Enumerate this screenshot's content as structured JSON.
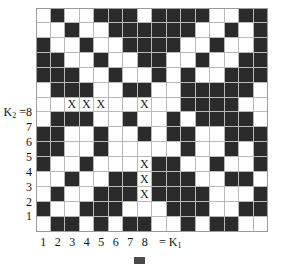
{
  "figure": {
    "type": "lattice-grid-diagram",
    "title": "",
    "caption": "",
    "caption_swatch_color": "#4a4a4a"
  },
  "colors": {
    "filled": "#2b2b2b",
    "empty": "#ffffff",
    "gridline": "#b9b9b9",
    "frame": "#9a9a9a",
    "text": "#111111"
  },
  "axes": {
    "x": {
      "name": "K",
      "name_sub": "1",
      "equals_label": "= K",
      "ticks": [
        "1",
        "2",
        "3",
        "4",
        "5",
        "6",
        "7",
        "8"
      ]
    },
    "y": {
      "name": "K",
      "name_sub": "2",
      "head_label": "K",
      "head_equals": "=8",
      "ticks": [
        "8",
        "7",
        "6",
        "5",
        "4",
        "3",
        "2",
        "1"
      ]
    }
  },
  "grid": {
    "columns": 16,
    "rows": 15,
    "cell_px": 14.5,
    "legend": "1 = filled (dark), 0 = empty (white)",
    "cells": [
      [
        0,
        1,
        0,
        0,
        1,
        1,
        1,
        0,
        1,
        1,
        1,
        1,
        0,
        0,
        1,
        1
      ],
      [
        0,
        0,
        1,
        0,
        0,
        1,
        1,
        1,
        1,
        1,
        1,
        0,
        0,
        1,
        0,
        1
      ],
      [
        1,
        0,
        0,
        1,
        0,
        0,
        1,
        1,
        1,
        1,
        0,
        0,
        1,
        0,
        0,
        1
      ],
      [
        1,
        1,
        0,
        0,
        1,
        0,
        0,
        1,
        1,
        0,
        0,
        1,
        0,
        0,
        1,
        1
      ],
      [
        1,
        1,
        1,
        0,
        0,
        1,
        0,
        0,
        1,
        0,
        1,
        0,
        0,
        1,
        1,
        1
      ],
      [
        0,
        1,
        1,
        1,
        0,
        0,
        1,
        1,
        0,
        0,
        1,
        1,
        1,
        1,
        1,
        0
      ],
      [
        0,
        0,
        0,
        0,
        0,
        0,
        0,
        0,
        0,
        0,
        1,
        1,
        1,
        1,
        0,
        0
      ],
      [
        0,
        1,
        1,
        1,
        0,
        0,
        1,
        0,
        0,
        1,
        0,
        1,
        1,
        1,
        1,
        0
      ],
      [
        1,
        1,
        0,
        0,
        1,
        0,
        0,
        1,
        0,
        1,
        1,
        0,
        0,
        1,
        1,
        1
      ],
      [
        1,
        1,
        0,
        0,
        1,
        0,
        0,
        0,
        0,
        0,
        1,
        0,
        0,
        1,
        0,
        1
      ],
      [
        1,
        0,
        0,
        1,
        0,
        0,
        0,
        0,
        1,
        1,
        0,
        0,
        1,
        0,
        0,
        1
      ],
      [
        0,
        0,
        1,
        0,
        0,
        1,
        1,
        0,
        1,
        1,
        1,
        0,
        0,
        1,
        1,
        0
      ],
      [
        0,
        1,
        0,
        0,
        1,
        1,
        1,
        0,
        1,
        1,
        1,
        1,
        0,
        0,
        0,
        1
      ],
      [
        1,
        0,
        0,
        1,
        1,
        1,
        0,
        0,
        0,
        1,
        1,
        1,
        0,
        0,
        1,
        1
      ],
      [
        0,
        1,
        1,
        0,
        1,
        0,
        1,
        1,
        0,
        0,
        1,
        0,
        1,
        1,
        0,
        0
      ]
    ],
    "marks": {
      "symbol": "X",
      "positions": [
        {
          "row": 6,
          "col": 2
        },
        {
          "row": 6,
          "col": 3
        },
        {
          "row": 6,
          "col": 4
        },
        {
          "row": 6,
          "col": 7
        },
        {
          "row": 10,
          "col": 7
        },
        {
          "row": 11,
          "col": 7
        },
        {
          "row": 12,
          "col": 7
        }
      ]
    }
  }
}
